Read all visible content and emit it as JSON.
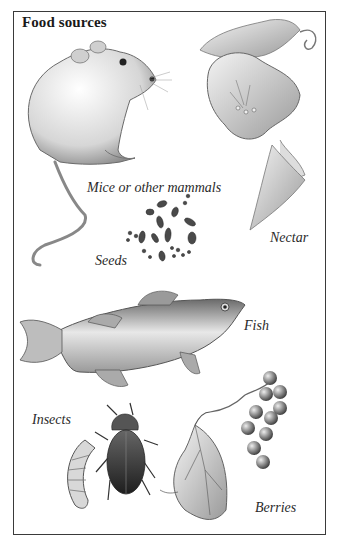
{
  "title": "Food sources",
  "labels": {
    "mammals": "Mice or other mammals",
    "nectar": "Nectar",
    "seeds": "Seeds",
    "fish": "Fish",
    "insects": "Insects",
    "berries": "Berries"
  },
  "illustrations": [
    "mouse-illustration",
    "flower-illustration",
    "seeds-illustration",
    "fish-illustration",
    "grub-illustration",
    "beetle-illustration",
    "leaf-illustration",
    "berries-illustration"
  ],
  "colors": {
    "border": "#3a3a3a",
    "ink": "#2a2a2a",
    "shade": "#8a8a8a",
    "background": "#ffffff"
  }
}
